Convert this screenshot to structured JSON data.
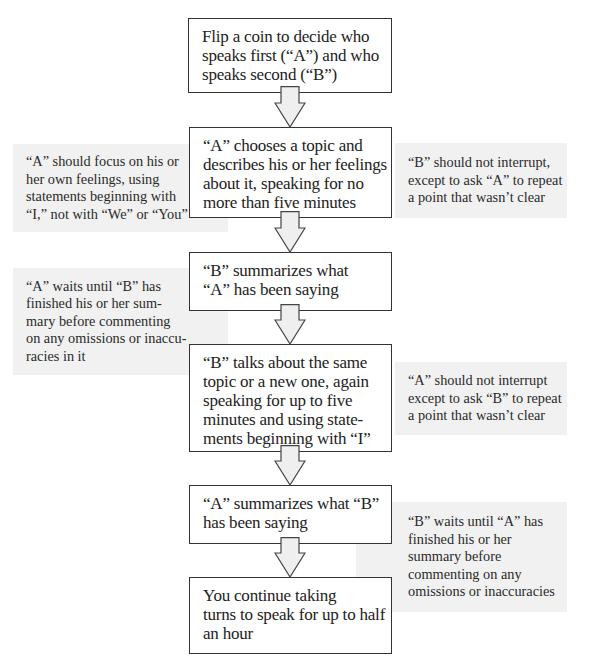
{
  "flow": {
    "steps": [
      {
        "id": "step-1",
        "lines": [
          "Flip a coin to decide who",
          "speaks first (“A”) and who",
          "speaks second (“B”)"
        ]
      },
      {
        "id": "step-2",
        "lines": [
          "“A” chooses a topic and",
          "describes his or her feelings",
          "about it, speaking for no",
          "more than five minutes"
        ]
      },
      {
        "id": "step-3",
        "lines": [
          "“B” summarizes what",
          "“A” has been saying"
        ]
      },
      {
        "id": "step-4",
        "lines": [
          "“B” talks about the same",
          "topic or a new one, again",
          "speaking for up to five",
          "minutes and using state-",
          "ments beginning with “I”"
        ]
      },
      {
        "id": "step-5",
        "lines": [
          "“A” summarizes what “B”",
          "has been saying"
        ]
      },
      {
        "id": "step-6",
        "lines": [
          "You continue taking",
          "turns to speak for up to half",
          "an hour"
        ]
      }
    ],
    "notes": [
      {
        "side": "left",
        "step": 2,
        "lines": [
          "“A” should focus on his or",
          "her own feelings, using",
          "statements beginning with",
          "“I,” not with “We” or “You”"
        ]
      },
      {
        "side": "right",
        "step": 2,
        "lines": [
          "“B” should not interrupt,",
          "except to ask “A” to repeat",
          "a point that wasn’t clear"
        ]
      },
      {
        "side": "left",
        "step": 3,
        "lines": [
          "“A” waits until “B” has",
          "finished  his or her sum-",
          "mary before commenting",
          "on any omissions or inaccu-",
          "racies in it"
        ]
      },
      {
        "side": "right",
        "step": 4,
        "lines": [
          "“A” should not interrupt",
          "except  to ask “B” to repeat",
          "a point that wasn’t clear"
        ]
      },
      {
        "side": "right",
        "step": 5,
        "lines": [
          "“B” waits until “A” has",
          "finished  his or her",
          "summary before",
          "commenting on any",
          "omissions or inaccuracies"
        ]
      }
    ]
  },
  "colors": {
    "box_border": "#333333",
    "note_fill": "#f1f1f1",
    "arrow_fill": "#efefef",
    "arrow_stroke": "#444444"
  }
}
